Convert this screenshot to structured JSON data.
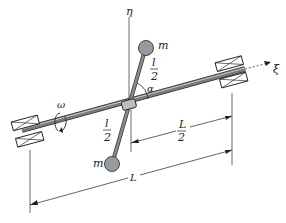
{
  "diagram": {
    "labels": {
      "eta_axis": "η",
      "xi_axis": "ξ",
      "mass_top": "m",
      "mass_bottom": "m",
      "angle": "α",
      "omega": "ω",
      "rod_half_top_num": "l",
      "rod_half_top_den": "2",
      "rod_half_bottom_num": "l",
      "rod_half_bottom_den": "2",
      "half_span_num": "L",
      "half_span_den": "2",
      "span": "L"
    },
    "colors": {
      "shaft": "#6e6e6e",
      "shaft_highlight": "#b8b8b8",
      "mass": "#9a9a9a",
      "line": "#222222",
      "bearing": "#ffffff"
    }
  }
}
